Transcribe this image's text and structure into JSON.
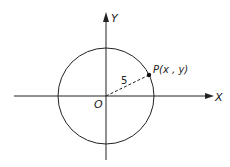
{
  "diagram": {
    "type": "coordinate-circle",
    "axes": {
      "x_label": "X",
      "y_label": "Y",
      "origin_label": "O"
    },
    "circle": {
      "center": "O",
      "radius_label": "5"
    },
    "point": {
      "label": "P(x , y)"
    }
  }
}
